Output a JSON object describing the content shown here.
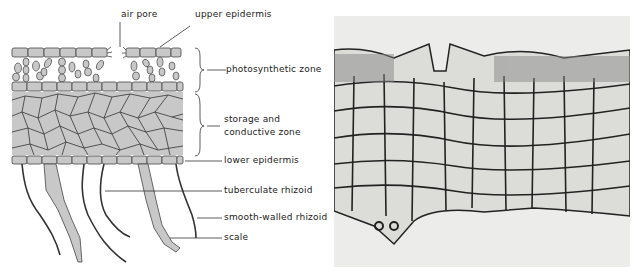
{
  "diagram": {
    "labels": {
      "air_pore": "air pore",
      "upper_epidermis": "upper epidermis",
      "photosynthetic_zone": "photosynthetic zone",
      "storage_line1": "storage and",
      "storage_line2": "conductive zone",
      "lower_epidermis": "lower epidermis",
      "tuberculate_rhizoid": "tuberculate rhizoid",
      "smooth_walled_rhizoid": "smooth-walled rhizoid",
      "scale": "scale"
    },
    "colors": {
      "cell_fill": "#c8c8c8",
      "line": "#333333",
      "photo_bg": "#ececea"
    }
  }
}
